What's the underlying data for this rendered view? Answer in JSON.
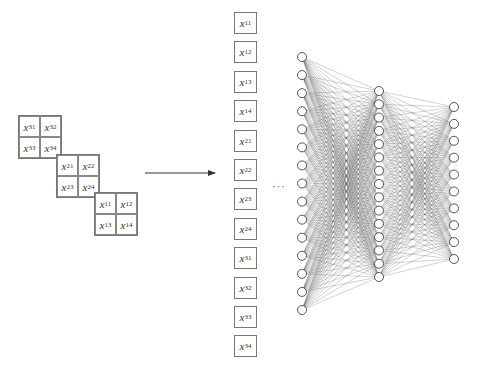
{
  "diagram": {
    "input_grids": [
      {
        "id": "grid-3",
        "cells": [
          {
            "var": "x",
            "sub": "31"
          },
          {
            "var": "x",
            "sub": "32"
          },
          {
            "var": "x",
            "sub": "33"
          },
          {
            "var": "x",
            "sub": "34"
          }
        ],
        "left": 18,
        "top": 115
      },
      {
        "id": "grid-2",
        "cells": [
          {
            "var": "x",
            "sub": "21"
          },
          {
            "var": "x",
            "sub": "22"
          },
          {
            "var": "x",
            "sub": "23"
          },
          {
            "var": "x",
            "sub": "24"
          }
        ],
        "left": 56,
        "top": 154
      },
      {
        "id": "grid-1",
        "cells": [
          {
            "var": "x",
            "sub": "11"
          },
          {
            "var": "x",
            "sub": "12"
          },
          {
            "var": "x",
            "sub": "13"
          },
          {
            "var": "x",
            "sub": "14"
          }
        ],
        "left": 94,
        "top": 192
      }
    ],
    "arrow": {
      "x1": 145,
      "y1": 173,
      "x2": 215,
      "y2": 173
    },
    "flattened_vector": [
      {
        "var": "x",
        "sub": "11"
      },
      {
        "var": "x",
        "sub": "12"
      },
      {
        "var": "x",
        "sub": "13"
      },
      {
        "var": "x",
        "sub": "14"
      },
      {
        "var": "x",
        "sub": "21"
      },
      {
        "var": "x",
        "sub": "22"
      },
      {
        "var": "x",
        "sub": "23"
      },
      {
        "var": "x",
        "sub": "24"
      },
      {
        "var": "x",
        "sub": "31"
      },
      {
        "var": "x",
        "sub": "32"
      },
      {
        "var": "x",
        "sub": "33"
      },
      {
        "var": "x",
        "sub": "34"
      }
    ],
    "vector_box_top_start": 12,
    "vector_box_spacing": 29.4,
    "ellipsis": "···",
    "network": {
      "layers": [
        {
          "name": "input-layer",
          "x": 302,
          "y_start": 57,
          "y_end": 310,
          "neurons": 15
        },
        {
          "name": "hidden-layer",
          "x": 379,
          "y_start": 91,
          "y_end": 277,
          "neurons": 15
        },
        {
          "name": "output-layer",
          "x": 454,
          "y_start": 107,
          "y_end": 259,
          "neurons": 10
        }
      ],
      "neuron_radius": 4.5,
      "edge_color": "#555555",
      "node_stroke": "#444444"
    }
  }
}
